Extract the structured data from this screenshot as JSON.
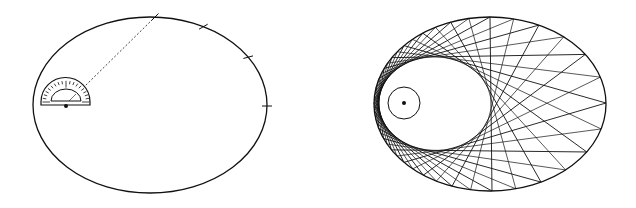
{
  "colors": {
    "ink": "#111111",
    "background": "#ffffff"
  },
  "left_figure": {
    "ellipse": {
      "cx": 150,
      "cy": 105,
      "rx": 117,
      "ry": 88
    },
    "focus": {
      "x": 66,
      "y": 106
    },
    "protractor": {
      "x0": 41,
      "x1": 90,
      "baseline_y": 105,
      "outer_r": 24,
      "inner_r": 15,
      "tick_count": 18
    },
    "tick_angles_deg": [
      0,
      15,
      30,
      45
    ],
    "dashed_line_angle_deg": 45
  },
  "right_figure": {
    "ellipse": {
      "cx": 490,
      "cy": 104,
      "rx": 116,
      "ry": 87
    },
    "focus": {
      "x": 404,
      "y": 103
    },
    "inner_circle_r": 16,
    "point_count": 24,
    "chord_step": 6
  }
}
